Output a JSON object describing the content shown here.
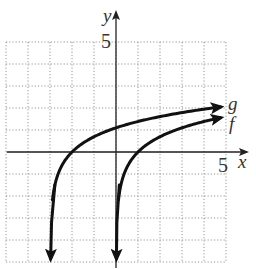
{
  "chart_data": {
    "type": "line",
    "title": "",
    "xlabel": "x",
    "ylabel": "y",
    "xlim": [
      -5,
      5
    ],
    "ylim": [
      -5,
      5
    ],
    "grid": true,
    "tick_labels": {
      "x": [
        "5"
      ],
      "y": [
        "5"
      ]
    },
    "series": [
      {
        "name": "g",
        "label": "g",
        "expression": "ln(x+3)",
        "asymptote_x": -3,
        "points": [
          [
            -2.95,
            -3.0
          ],
          [
            -2.8,
            -1.6
          ],
          [
            -2.5,
            -0.69
          ],
          [
            -2,
            0
          ],
          [
            -1,
            0.69
          ],
          [
            0,
            1.1
          ],
          [
            1,
            1.39
          ],
          [
            2,
            1.61
          ],
          [
            3,
            1.79
          ],
          [
            4,
            1.95
          ],
          [
            5,
            2.08
          ]
        ]
      },
      {
        "name": "f",
        "label": "f",
        "expression": "ln(x)",
        "asymptote_x": 0,
        "points": [
          [
            0.05,
            -3.0
          ],
          [
            0.2,
            -1.6
          ],
          [
            0.5,
            -0.69
          ],
          [
            1,
            0
          ],
          [
            2,
            0.69
          ],
          [
            3,
            1.1
          ],
          [
            4,
            1.39
          ],
          [
            5,
            1.61
          ]
        ]
      }
    ],
    "legend": "inline labels at right end of curves"
  },
  "labels": {
    "x_axis": "x",
    "y_axis": "y",
    "x_tick": "5",
    "y_tick": "5",
    "g": "g",
    "f": "f"
  }
}
